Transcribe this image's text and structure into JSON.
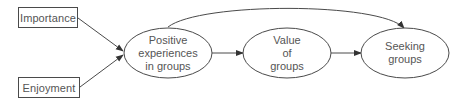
{
  "diagram": {
    "type": "path-diagram",
    "nodes": {
      "importance": {
        "label": "Importance",
        "shape": "rectangle"
      },
      "enjoyment": {
        "label": "Enjoyment",
        "shape": "rectangle"
      },
      "positive": {
        "lines": [
          "Positive",
          "experiences",
          "in groups"
        ],
        "shape": "ellipse"
      },
      "value": {
        "lines": [
          "Value",
          "of",
          "groups"
        ],
        "shape": "ellipse"
      },
      "seeking": {
        "lines": [
          "Seeking",
          "groups"
        ],
        "shape": "ellipse"
      }
    },
    "edges": [
      {
        "from": "Importance",
        "to": "Positive experiences in groups"
      },
      {
        "from": "Enjoyment",
        "to": "Positive experiences in groups"
      },
      {
        "from": "Positive experiences in groups",
        "to": "Value of groups"
      },
      {
        "from": "Value of groups",
        "to": "Seeking groups"
      },
      {
        "from": "Positive experiences in groups",
        "to": "Seeking groups",
        "style": "curved-arc"
      }
    ],
    "colors": {
      "stroke": "#4a4a4a",
      "text": "#555555",
      "background": "#ffffff"
    }
  }
}
